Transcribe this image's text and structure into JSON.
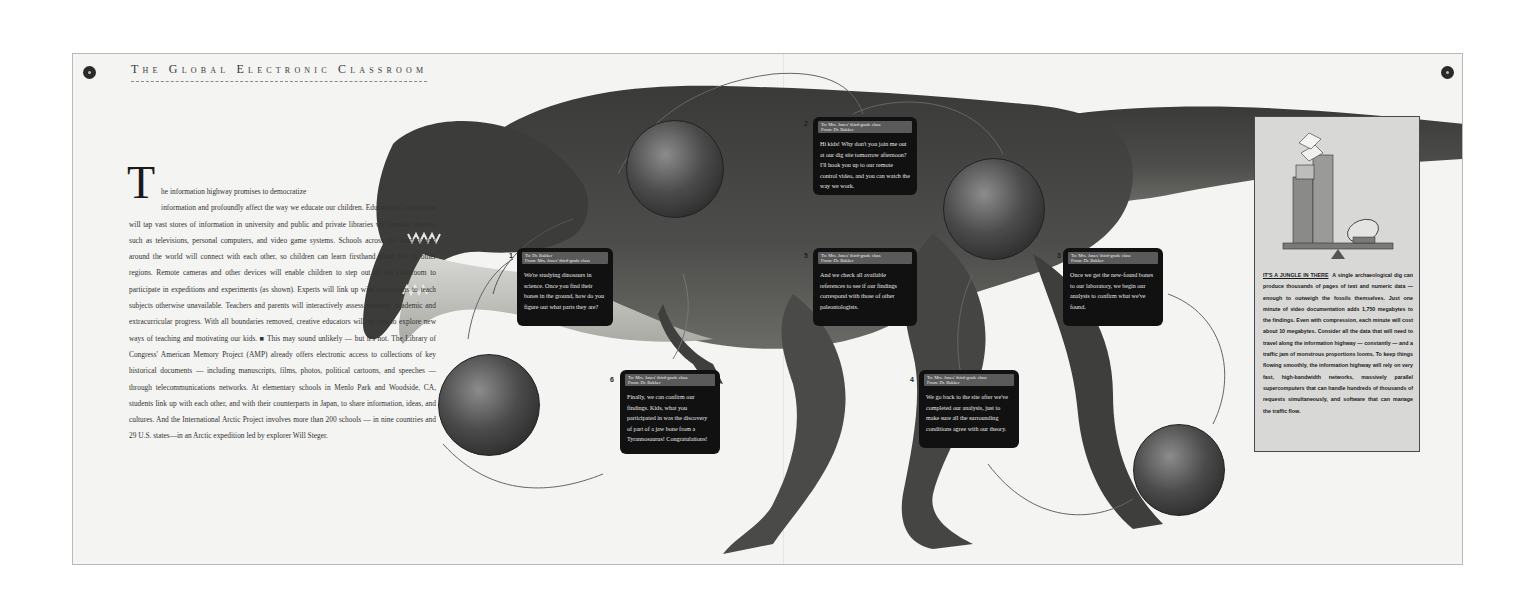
{
  "page": {
    "running_head": "The Global Electronic Classroom",
    "folio_left": "●",
    "folio_right": "●"
  },
  "article": {
    "dropcap": "T",
    "first_line": "he information highway promises to democratize",
    "body": "information and profoundly affect the way we educate our children. Educational institutions will tap vast stores of information in university and public and private libraries via familiar devices such as televisions, personal computers, and video game systems. Schools across the country and around the world will connect with each other, so children can learn firsthand about life in other regions. Remote cameras and other devices will enable children to step out of the classroom to participate in expeditions and experiments (as shown). Experts will link up with classrooms to teach subjects otherwise unavailable. Teachers and parents will interactively assess students' academic and extracurricular progress. With all boundaries removed, creative educators will be free to explore new ways of teaching and motivating our kids. ■ This may sound unlikely — but it's not. The Library of Congress' American Memory Project (AMP) already offers electronic access to collections of key historical documents — including manuscripts, films, photos, political cartoons, and speeches — through telecommunications networks. At elementary schools in Menlo Park and Woodside, CA, students link up with each other, and with their counterparts in Japan, to share information, ideas, and cultures. And the International Arctic Project involves more than 200 schools — in nine countries and 29 U.S. states—in an Arctic expedition led by explorer Will Steger."
  },
  "messages": [
    {
      "number": "1",
      "to": "To: Dr. Bakker",
      "from": "From: Mrs. Jones' third-grade class",
      "text": "We're studying dinosaurs in science. Once you find their bones in the ground, how do you figure out what parts they are?"
    },
    {
      "number": "2",
      "to": "To: Mrs. Jones' third-grade class",
      "from": "From: Dr. Bakker",
      "text": "Hi kids! Why don't you join me out at our dig site tomorrow afternoon? I'll hook you up to our remote control video, and you can watch the way we work."
    },
    {
      "number": "3",
      "to": "To: Mrs. Jones' third-grade class",
      "from": "From: Dr. Bakker",
      "text": "Once we get the new-found bones to our laboratory, we begin our analysis to confirm what we've found."
    },
    {
      "number": "4",
      "to": "To: Mrs. Jones' third-grade class",
      "from": "From: Dr. Bakker",
      "text": "We go back to the site after we've completed our analysis, just to make sure all the surrounding conditions agree with our theory."
    },
    {
      "number": "5",
      "to": "To: Mrs. Jones' third-grade class",
      "from": "From: Dr. Bakker",
      "text": "And we check all available references to see if our findings correspond with those of other paleontologists."
    },
    {
      "number": "6",
      "to": "To: Mrs. Jones' third-grade class",
      "from": "From: Dr. Bakker",
      "text": "Finally, we can confirm our findings. Kids, what you participated in was the discovery of part of a jaw bone from a Tyrannosaurus! Congratulations!"
    }
  ],
  "sidebar": {
    "illustration": "scale-balancing-data-stacks-and-satellite-dish",
    "kicker": "IT'S A JUNGLE IN THERE",
    "text": "A single archaeological dig can produce thousands of pages of text and numeric data — enough to outweigh the fossils themselves. Just one minute of video documentation adds 1,750 megabytes to the findings. Even with compression, each minute will cost about 10 megabytes. Consider all the data that will need to travel along the information highway — constantly — and a traffic jam of monstrous proportions looms. To keep things flowing smoothly, the information highway will rely on very fast, high-bandwidth networks, massively parallel supercomputers that can handle hundreds of thousands of requests simultaneously, and software that can manage the traffic flow."
  },
  "colors": {
    "page": "#f4f4f2",
    "dino_body": "#4a4a48",
    "bubble": "#111111",
    "sidebar_bg": "#d8d8d6"
  }
}
